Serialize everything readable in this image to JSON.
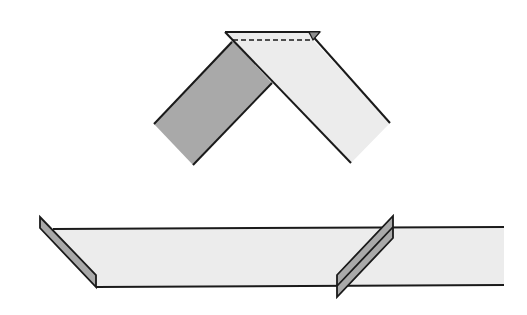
{
  "diagram": {
    "type": "strip-folding-illustration",
    "colors": {
      "background": "#ffffff",
      "light_fill": "#ececec",
      "dark_fill": "#a9a9a9",
      "stroke": "#1a1a1a"
    },
    "figures": [
      {
        "id": "mitered-corner",
        "description": "Two strips meeting at a mitered point with a fold line at the top"
      },
      {
        "id": "long-strip-with-folds",
        "description": "Horizontal strip with angled fold at left end and pleat near right"
      }
    ]
  }
}
